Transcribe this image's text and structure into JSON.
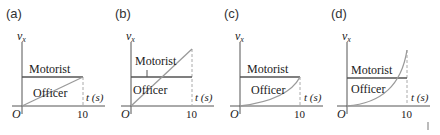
{
  "figure": {
    "panels": [
      {
        "label": "(a)",
        "y_axis": "v",
        "y_sub": "x",
        "x_axis": "t (s)",
        "origin": "O",
        "tick": "10",
        "motorist_label": "Motorist",
        "officer_label": "Officer",
        "officer_shape": "linear-to-motorist"
      },
      {
        "label": "(b)",
        "y_axis": "v",
        "y_sub": "x",
        "x_axis": "t (s)",
        "origin": "O",
        "tick": "10",
        "motorist_label": "Motorist",
        "officer_label": "Officer",
        "officer_shape": "linear-to-double"
      },
      {
        "label": "(c)",
        "y_axis": "v",
        "y_sub": "x",
        "x_axis": "t (s)",
        "origin": "O",
        "tick": "10",
        "motorist_label": "Motorist",
        "officer_label": "Officer",
        "officer_shape": "concave-up-to-motorist"
      },
      {
        "label": "(d)",
        "y_axis": "v",
        "y_sub": "x",
        "x_axis": "t (s)",
        "origin": "O",
        "tick": "10",
        "motorist_label": "Motorist",
        "officer_label": "Officer",
        "officer_shape": "concave-up-exceeds"
      }
    ]
  },
  "colors": {
    "axis": "#555555",
    "motorist": "#555555",
    "officer": "#9a9a9a",
    "dashed": "#aaaaaa"
  }
}
